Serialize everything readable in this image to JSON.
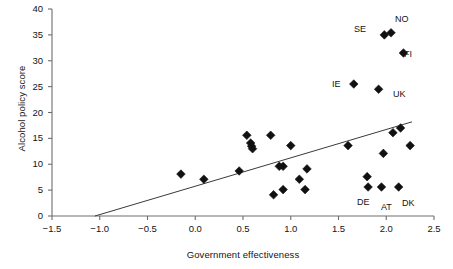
{
  "chart_data": {
    "type": "scatter",
    "title": "",
    "xlabel": "Government effectiveness",
    "ylabel": "Alcohol policy score",
    "xlim": [
      -1.5,
      2.5
    ],
    "ylim": [
      0,
      40
    ],
    "xticks": [
      "−1.5",
      "−1.0",
      "−0.5",
      "0.0",
      "0.5",
      "1.0",
      "1.5",
      "2.0",
      "2.5"
    ],
    "xtick_values": [
      -1.5,
      -1.0,
      -0.5,
      0.0,
      0.5,
      1.0,
      1.5,
      2.0,
      2.5
    ],
    "yticks": [
      "0",
      "5",
      "10",
      "15",
      "20",
      "25",
      "30",
      "35",
      "40"
    ],
    "ytick_values": [
      0,
      5,
      10,
      15,
      20,
      25,
      30,
      35,
      40
    ],
    "grid": false,
    "legend": "none",
    "marker": "filled-diamond",
    "marker_color": "#111111",
    "axis_color": "#6e6e6e",
    "points": [
      {
        "x": -0.15,
        "y": 8.1,
        "label": ""
      },
      {
        "x": 0.09,
        "y": 7.1,
        "label": ""
      },
      {
        "x": 0.46,
        "y": 8.7,
        "label": ""
      },
      {
        "x": 0.54,
        "y": 15.6,
        "label": ""
      },
      {
        "x": 0.58,
        "y": 14.1,
        "label": ""
      },
      {
        "x": 0.59,
        "y": 13.5,
        "label": ""
      },
      {
        "x": 0.6,
        "y": 13.0,
        "label": ""
      },
      {
        "x": 0.79,
        "y": 15.6,
        "label": ""
      },
      {
        "x": 0.82,
        "y": 4.1,
        "label": ""
      },
      {
        "x": 0.88,
        "y": 9.6,
        "label": ""
      },
      {
        "x": 0.92,
        "y": 9.6,
        "label": ""
      },
      {
        "x": 0.92,
        "y": 5.1,
        "label": ""
      },
      {
        "x": 1.0,
        "y": 13.6,
        "label": ""
      },
      {
        "x": 1.09,
        "y": 7.1,
        "label": ""
      },
      {
        "x": 1.15,
        "y": 5.1,
        "label": ""
      },
      {
        "x": 1.17,
        "y": 9.1,
        "label": ""
      },
      {
        "x": 1.6,
        "y": 13.6,
        "label": ""
      },
      {
        "x": 1.66,
        "y": 25.5,
        "label": "IE"
      },
      {
        "x": 1.8,
        "y": 7.6,
        "label": ""
      },
      {
        "x": 1.81,
        "y": 5.6,
        "label": "DE"
      },
      {
        "x": 1.92,
        "y": 24.5,
        "label": "UK"
      },
      {
        "x": 1.95,
        "y": 5.6,
        "label": "AT"
      },
      {
        "x": 1.97,
        "y": 12.1,
        "label": ""
      },
      {
        "x": 1.98,
        "y": 35.0,
        "label": "SE"
      },
      {
        "x": 2.05,
        "y": 35.4,
        "label": "NO"
      },
      {
        "x": 2.07,
        "y": 16.1,
        "label": ""
      },
      {
        "x": 2.13,
        "y": 5.6,
        "label": "DK"
      },
      {
        "x": 2.15,
        "y": 17.0,
        "label": ""
      },
      {
        "x": 2.18,
        "y": 31.5,
        "label": "FI"
      },
      {
        "x": 2.25,
        "y": 13.6,
        "label": ""
      }
    ],
    "trendline": {
      "x0": -1.05,
      "y0": 0.0,
      "x1": 2.27,
      "y1": 18.2
    }
  },
  "annotations": [
    {
      "text": "SE",
      "x": 354,
      "y": 25
    },
    {
      "text": "NO",
      "x": 395,
      "y": 15
    },
    {
      "text": "FI",
      "x": 404,
      "y": 50
    },
    {
      "text": "IE",
      "x": 332,
      "y": 80
    },
    {
      "text": "UK",
      "x": 393,
      "y": 90
    },
    {
      "text": "DE",
      "x": 357,
      "y": 198
    },
    {
      "text": "AT",
      "x": 381,
      "y": 203
    },
    {
      "text": "DK",
      "x": 402,
      "y": 199
    }
  ]
}
